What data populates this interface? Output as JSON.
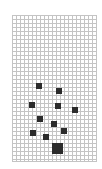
{
  "board": {
    "grid_color": "#c4c4c4",
    "piece_color": "#2b2b2b",
    "columns": 21,
    "rows": 37,
    "cell_px": 4
  },
  "pieces": [
    {
      "x": 36,
      "y": 83,
      "size": 6
    },
    {
      "x": 56,
      "y": 88,
      "size": 6
    },
    {
      "x": 29,
      "y": 102,
      "size": 6
    },
    {
      "x": 55,
      "y": 103,
      "size": 6
    },
    {
      "x": 72,
      "y": 107,
      "size": 6
    },
    {
      "x": 37,
      "y": 116,
      "size": 6
    },
    {
      "x": 51,
      "y": 121,
      "size": 6
    },
    {
      "x": 30,
      "y": 130,
      "size": 6
    },
    {
      "x": 61,
      "y": 128,
      "size": 6
    },
    {
      "x": 43,
      "y": 134,
      "size": 6
    },
    {
      "x": 52,
      "y": 143,
      "size": 11
    }
  ]
}
